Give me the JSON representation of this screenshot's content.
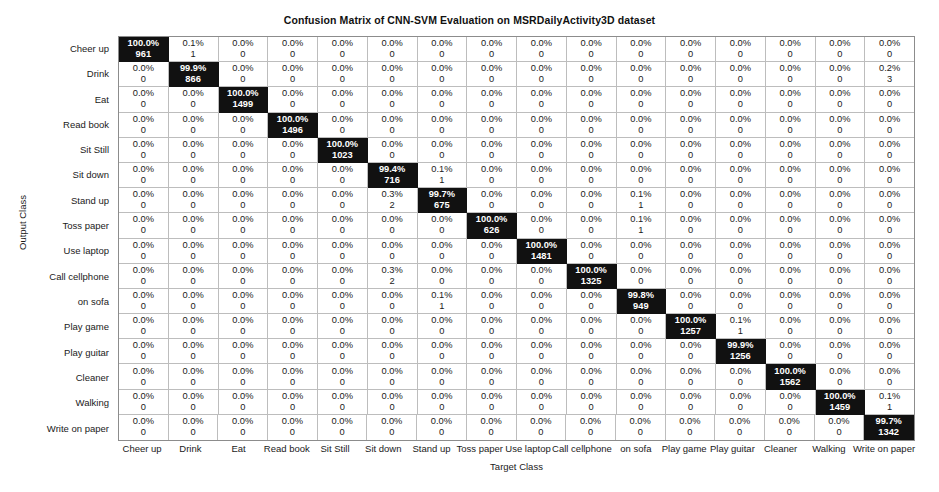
{
  "chart_data": {
    "type": "heatmap",
    "title": "Confusion Matrix of CNN-SVM Evaluation on MSRDailyActivity3D dataset",
    "xlabel": "Target Class",
    "ylabel": "Output Class",
    "grid": true,
    "legend_position": "none",
    "categories": [
      "Cheer up",
      "Drink",
      "Eat",
      "Read book",
      "Sit Still",
      "Sit down",
      "Stand up",
      "Toss paper",
      "Use laptop",
      "Call cellphone",
      "on sofa",
      "Play game",
      "Play guitar",
      "Cleaner",
      "Walking",
      "Write on paper"
    ],
    "row_labels": [
      "Cheer up",
      "Drink",
      "Eat",
      "Read book",
      "Sit Still",
      "Sit down",
      "Stand up",
      "Toss paper",
      "Use laptop",
      "Call cellphone",
      "on sofa",
      "Play game",
      "Play guitar",
      "Cleaner",
      "Walking",
      "Write on paper"
    ],
    "col_labels": [
      "Cheer up",
      "Drink",
      "Eat",
      "Read book",
      "Sit Still",
      "Sit down",
      "Stand up",
      "Toss paper",
      "Use laptop",
      "Call cellphone",
      "on sofa",
      "Play game",
      "Play guitar",
      "Cleaner",
      "Walking",
      "Write on paper"
    ],
    "percent_values": [
      [
        "100.0%",
        "0.1%",
        "0.0%",
        "0.0%",
        "0.0%",
        "0.0%",
        "0.0%",
        "0.0%",
        "0.0%",
        "0.0%",
        "0.0%",
        "0.0%",
        "0.0%",
        "0.0%",
        "0.0%",
        "0.0%"
      ],
      [
        "0.0%",
        "99.9%",
        "0.0%",
        "0.0%",
        "0.0%",
        "0.0%",
        "0.0%",
        "0.0%",
        "0.0%",
        "0.0%",
        "0.0%",
        "0.0%",
        "0.0%",
        "0.0%",
        "0.0%",
        "0.2%"
      ],
      [
        "0.0%",
        "0.0%",
        "100.0%",
        "0.0%",
        "0.0%",
        "0.0%",
        "0.0%",
        "0.0%",
        "0.0%",
        "0.0%",
        "0.0%",
        "0.0%",
        "0.0%",
        "0.0%",
        "0.0%",
        "0.0%"
      ],
      [
        "0.0%",
        "0.0%",
        "0.0%",
        "100.0%",
        "0.0%",
        "0.0%",
        "0.0%",
        "0.0%",
        "0.0%",
        "0.0%",
        "0.0%",
        "0.0%",
        "0.0%",
        "0.0%",
        "0.0%",
        "0.0%"
      ],
      [
        "0.0%",
        "0.0%",
        "0.0%",
        "0.0%",
        "100.0%",
        "0.0%",
        "0.0%",
        "0.0%",
        "0.0%",
        "0.0%",
        "0.0%",
        "0.0%",
        "0.0%",
        "0.0%",
        "0.0%",
        "0.0%"
      ],
      [
        "0.0%",
        "0.0%",
        "0.0%",
        "0.0%",
        "0.0%",
        "99.4%",
        "0.1%",
        "0.0%",
        "0.0%",
        "0.0%",
        "0.0%",
        "0.0%",
        "0.0%",
        "0.0%",
        "0.0%",
        "0.0%"
      ],
      [
        "0.0%",
        "0.0%",
        "0.0%",
        "0.0%",
        "0.0%",
        "0.3%",
        "99.7%",
        "0.0%",
        "0.0%",
        "0.0%",
        "0.1%",
        "0.0%",
        "0.0%",
        "0.0%",
        "0.0%",
        "0.0%"
      ],
      [
        "0.0%",
        "0.0%",
        "0.0%",
        "0.0%",
        "0.0%",
        "0.0%",
        "0.0%",
        "100.0%",
        "0.0%",
        "0.0%",
        "0.1%",
        "0.0%",
        "0.0%",
        "0.0%",
        "0.0%",
        "0.0%"
      ],
      [
        "0.0%",
        "0.0%",
        "0.0%",
        "0.0%",
        "0.0%",
        "0.0%",
        "0.0%",
        "0.0%",
        "100.0%",
        "0.0%",
        "0.0%",
        "0.0%",
        "0.0%",
        "0.0%",
        "0.0%",
        "0.0%"
      ],
      [
        "0.0%",
        "0.0%",
        "0.0%",
        "0.0%",
        "0.0%",
        "0.3%",
        "0.0%",
        "0.0%",
        "0.0%",
        "100.0%",
        "0.0%",
        "0.0%",
        "0.0%",
        "0.0%",
        "0.0%",
        "0.0%"
      ],
      [
        "0.0%",
        "0.0%",
        "0.0%",
        "0.0%",
        "0.0%",
        "0.0%",
        "0.1%",
        "0.0%",
        "0.0%",
        "0.0%",
        "99.8%",
        "0.0%",
        "0.0%",
        "0.0%",
        "0.0%",
        "0.0%"
      ],
      [
        "0.0%",
        "0.0%",
        "0.0%",
        "0.0%",
        "0.0%",
        "0.0%",
        "0.0%",
        "0.0%",
        "0.0%",
        "0.0%",
        "0.0%",
        "100.0%",
        "0.1%",
        "0.0%",
        "0.0%",
        "0.0%"
      ],
      [
        "0.0%",
        "0.0%",
        "0.0%",
        "0.0%",
        "0.0%",
        "0.0%",
        "0.0%",
        "0.0%",
        "0.0%",
        "0.0%",
        "0.0%",
        "0.0%",
        "99.9%",
        "0.0%",
        "0.0%",
        "0.0%"
      ],
      [
        "0.0%",
        "0.0%",
        "0.0%",
        "0.0%",
        "0.0%",
        "0.0%",
        "0.0%",
        "0.0%",
        "0.0%",
        "0.0%",
        "0.0%",
        "0.0%",
        "0.0%",
        "100.0%",
        "0.0%",
        "0.0%"
      ],
      [
        "0.0%",
        "0.0%",
        "0.0%",
        "0.0%",
        "0.0%",
        "0.0%",
        "0.0%",
        "0.0%",
        "0.0%",
        "0.0%",
        "0.0%",
        "0.0%",
        "0.0%",
        "0.0%",
        "100.0%",
        "0.1%"
      ],
      [
        "0.0%",
        "0.0%",
        "0.0%",
        "0.0%",
        "0.0%",
        "0.0%",
        "0.0%",
        "0.0%",
        "0.0%",
        "0.0%",
        "0.0%",
        "0.0%",
        "0.0%",
        "0.0%",
        "0.0%",
        "99.7%"
      ]
    ],
    "count_values": [
      [
        "961",
        "1",
        "0",
        "0",
        "0",
        "0",
        "0",
        "0",
        "0",
        "0",
        "0",
        "0",
        "0",
        "0",
        "0",
        "0"
      ],
      [
        "0",
        "866",
        "0",
        "0",
        "0",
        "0",
        "0",
        "0",
        "0",
        "0",
        "0",
        "0",
        "0",
        "0",
        "0",
        "3"
      ],
      [
        "0",
        "0",
        "1499",
        "0",
        "0",
        "0",
        "0",
        "0",
        "0",
        "0",
        "0",
        "0",
        "0",
        "0",
        "0",
        "0"
      ],
      [
        "0",
        "0",
        "0",
        "1496",
        "0",
        "0",
        "0",
        "0",
        "0",
        "0",
        "0",
        "0",
        "0",
        "0",
        "0",
        "0"
      ],
      [
        "0",
        "0",
        "0",
        "0",
        "1023",
        "0",
        "0",
        "0",
        "0",
        "0",
        "0",
        "0",
        "0",
        "0",
        "0",
        "0"
      ],
      [
        "0",
        "0",
        "0",
        "0",
        "0",
        "716",
        "1",
        "0",
        "0",
        "0",
        "0",
        "0",
        "0",
        "0",
        "0",
        "0"
      ],
      [
        "0",
        "0",
        "0",
        "0",
        "0",
        "2",
        "675",
        "0",
        "0",
        "0",
        "1",
        "0",
        "0",
        "0",
        "0",
        "0"
      ],
      [
        "0",
        "0",
        "0",
        "0",
        "0",
        "0",
        "0",
        "626",
        "0",
        "0",
        "1",
        "0",
        "0",
        "0",
        "0",
        "0"
      ],
      [
        "0",
        "0",
        "0",
        "0",
        "0",
        "0",
        "0",
        "0",
        "1481",
        "0",
        "0",
        "0",
        "0",
        "0",
        "0",
        "0"
      ],
      [
        "0",
        "0",
        "0",
        "0",
        "0",
        "2",
        "0",
        "0",
        "0",
        "1325",
        "0",
        "0",
        "0",
        "0",
        "0",
        "0"
      ],
      [
        "0",
        "0",
        "0",
        "0",
        "0",
        "0",
        "1",
        "0",
        "0",
        "0",
        "949",
        "0",
        "0",
        "0",
        "0",
        "0"
      ],
      [
        "0",
        "0",
        "0",
        "0",
        "0",
        "0",
        "0",
        "0",
        "0",
        "0",
        "0",
        "1257",
        "1",
        "0",
        "0",
        "0"
      ],
      [
        "0",
        "0",
        "0",
        "0",
        "0",
        "0",
        "0",
        "0",
        "0",
        "0",
        "0",
        "0",
        "1256",
        "0",
        "0",
        "0"
      ],
      [
        "0",
        "0",
        "0",
        "0",
        "0",
        "0",
        "0",
        "0",
        "0",
        "0",
        "0",
        "0",
        "0",
        "1562",
        "0",
        "0"
      ],
      [
        "0",
        "0",
        "0",
        "0",
        "0",
        "0",
        "0",
        "0",
        "0",
        "0",
        "0",
        "0",
        "0",
        "0",
        "1459",
        "1"
      ],
      [
        "0",
        "0",
        "0",
        "0",
        "0",
        "0",
        "0",
        "0",
        "0",
        "0",
        "0",
        "0",
        "0",
        "0",
        "0",
        "1342"
      ]
    ],
    "diagonal_cell_color": "#111111",
    "offdiagonal_cell_color": "#ffffff",
    "grid_line_color": "#bdbdbd",
    "border_color": "#8c8c8c"
  }
}
